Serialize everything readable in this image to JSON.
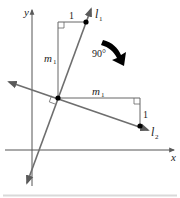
{
  "diagram": {
    "axes": {
      "x_label": "x",
      "y_label": "y"
    },
    "lines": [
      {
        "id": "l1",
        "label": "l",
        "subscript": "1"
      },
      {
        "id": "l2",
        "label": "l",
        "subscript": "2"
      }
    ],
    "triangle_l1": {
      "run_label": "1",
      "rise_label": "m",
      "rise_subscript": "1"
    },
    "triangle_l2": {
      "run_label": "m",
      "run_subscript": "1",
      "rise_label": "1"
    },
    "rotation": {
      "label": "90°"
    },
    "colors": {
      "line": "#6e6e6e",
      "axis": "#555555",
      "point": "#000000",
      "divider": "#d9d9d9"
    }
  }
}
